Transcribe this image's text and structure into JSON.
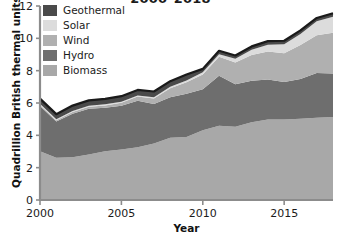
{
  "chart_data": {
    "type": "area",
    "stacked": true,
    "title": "2000–2018",
    "xlabel": "Year",
    "ylabel": "Quadrillion British thermal units",
    "xlim": [
      2000,
      2018
    ],
    "ylim": [
      0,
      12
    ],
    "grid": false,
    "legend_position": "top-left-inside",
    "x_ticks": [
      "2000",
      "2005",
      "2010",
      "2015"
    ],
    "x_tick_values": [
      2000,
      2005,
      2010,
      2015
    ],
    "y_ticks": [
      "0",
      "2",
      "4",
      "6",
      "8",
      "10",
      "12"
    ],
    "y_tick_values": [
      0,
      2,
      4,
      6,
      8,
      10,
      12
    ],
    "x": [
      2000,
      2001,
      2002,
      2003,
      2004,
      2005,
      2006,
      2007,
      2008,
      2009,
      2010,
      2011,
      2012,
      2013,
      2014,
      2015,
      2016,
      2017,
      2018
    ],
    "stack_order_bottom_to_top": [
      "Biomass",
      "Hydro",
      "Wind",
      "Solar",
      "Geothermal"
    ],
    "series": [
      {
        "name": "Geothermal",
        "color": "#4a4a4a",
        "values": [
          0.32,
          0.31,
          0.33,
          0.33,
          0.34,
          0.34,
          0.34,
          0.35,
          0.35,
          0.37,
          0.21,
          0.21,
          0.21,
          0.21,
          0.22,
          0.22,
          0.22,
          0.21,
          0.21
        ]
      },
      {
        "name": "Solar",
        "color": "#dcdcdc",
        "values": [
          0.07,
          0.07,
          0.06,
          0.06,
          0.07,
          0.07,
          0.07,
          0.08,
          0.09,
          0.1,
          0.13,
          0.16,
          0.23,
          0.32,
          0.43,
          0.55,
          0.68,
          0.86,
          0.99
        ]
      },
      {
        "name": "Wind",
        "color": "#b0b0b0",
        "values": [
          0.06,
          0.07,
          0.11,
          0.12,
          0.14,
          0.18,
          0.26,
          0.34,
          0.55,
          0.72,
          0.92,
          1.17,
          1.34,
          1.6,
          1.73,
          1.78,
          2.1,
          2.34,
          2.53
        ]
      },
      {
        "name": "Hydro",
        "color": "#6e6e6e",
        "values": [
          2.81,
          2.24,
          2.69,
          2.83,
          2.69,
          2.7,
          2.87,
          2.45,
          2.51,
          2.67,
          2.54,
          3.1,
          2.63,
          2.56,
          2.47,
          2.32,
          2.47,
          2.77,
          2.69
        ]
      },
      {
        "name": "Biomass",
        "color": "#a8a8a8",
        "values": [
          3.01,
          2.62,
          2.65,
          2.82,
          3.02,
          3.13,
          3.27,
          3.49,
          3.85,
          3.9,
          4.31,
          4.59,
          4.53,
          4.81,
          4.98,
          4.98,
          5.02,
          5.08,
          5.13
        ]
      }
    ],
    "totals": [
      6.27,
      5.31,
      5.84,
      6.16,
      6.26,
      6.42,
      6.81,
      6.71,
      7.35,
      7.76,
      8.11,
      9.23,
      8.94,
      9.5,
      9.83,
      9.85,
      10.49,
      11.26,
      11.55
    ]
  },
  "legend": {
    "items": [
      {
        "label": "Geothermal",
        "color": "#4a4a4a"
      },
      {
        "label": "Solar",
        "color": "#dcdcdc"
      },
      {
        "label": "Wind",
        "color": "#b0b0b0"
      },
      {
        "label": "Hydro",
        "color": "#6e6e6e"
      },
      {
        "label": "Biomass",
        "color": "#a8a8a8"
      }
    ]
  },
  "axes": {
    "axis_color": "#8c8c8c",
    "outline_color": "#1a1a1a",
    "text_color": "#1b1b1b"
  }
}
